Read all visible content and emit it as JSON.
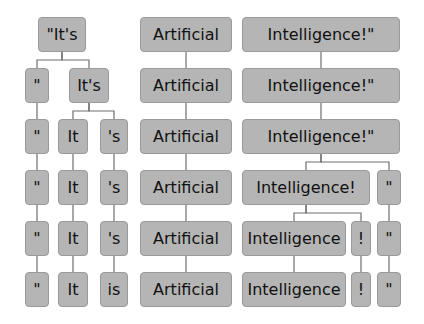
{
  "colors": {
    "node_fill": "#b5b5b5",
    "node_border": "#9a9a9a",
    "edge": "#6e6e6e",
    "text": "#111111"
  },
  "rows": [
    [
      {
        "id": "r1a",
        "text": "\"It's",
        "x": 38,
        "w": 48
      },
      {
        "id": "r1b",
        "text": "Artificial",
        "x": 140,
        "w": 92
      },
      {
        "id": "r1c",
        "text": "Intelligence!\"",
        "x": 242,
        "w": 158
      }
    ],
    [
      {
        "id": "r2a",
        "text": "\"",
        "x": 25,
        "w": 24
      },
      {
        "id": "r2b",
        "text": "It's",
        "x": 69,
        "w": 40
      },
      {
        "id": "r2c",
        "text": "Artificial",
        "x": 140,
        "w": 92
      },
      {
        "id": "r2d",
        "text": "Intelligence!\"",
        "x": 242,
        "w": 158
      }
    ],
    [
      {
        "id": "r3a",
        "text": "\"",
        "x": 25,
        "w": 24
      },
      {
        "id": "r3b",
        "text": "It",
        "x": 58,
        "w": 30
      },
      {
        "id": "r3c",
        "text": "'s",
        "x": 100,
        "w": 28
      },
      {
        "id": "r3d",
        "text": "Artificial",
        "x": 140,
        "w": 92
      },
      {
        "id": "r3e",
        "text": "Intelligence!\"",
        "x": 242,
        "w": 158
      }
    ],
    [
      {
        "id": "r4a",
        "text": "\"",
        "x": 25,
        "w": 24
      },
      {
        "id": "r4b",
        "text": "It",
        "x": 58,
        "w": 30
      },
      {
        "id": "r4c",
        "text": "'s",
        "x": 100,
        "w": 28
      },
      {
        "id": "r4d",
        "text": "Artificial",
        "x": 140,
        "w": 92
      },
      {
        "id": "r4e",
        "text": "Intelligence!",
        "x": 242,
        "w": 128
      },
      {
        "id": "r4f",
        "text": "\"",
        "x": 377,
        "w": 24
      }
    ],
    [
      {
        "id": "r5a",
        "text": "\"",
        "x": 25,
        "w": 24
      },
      {
        "id": "r5b",
        "text": "It",
        "x": 58,
        "w": 30
      },
      {
        "id": "r5c",
        "text": "'s",
        "x": 100,
        "w": 28
      },
      {
        "id": "r5d",
        "text": "Artificial",
        "x": 140,
        "w": 92
      },
      {
        "id": "r5e",
        "text": "Intelligence",
        "x": 242,
        "w": 104
      },
      {
        "id": "r5f",
        "text": "!",
        "x": 351,
        "w": 20
      },
      {
        "id": "r5g",
        "text": "\"",
        "x": 377,
        "w": 24
      }
    ],
    [
      {
        "id": "r6a",
        "text": "\"",
        "x": 25,
        "w": 24
      },
      {
        "id": "r6b",
        "text": "It",
        "x": 58,
        "w": 30
      },
      {
        "id": "r6c",
        "text": "is",
        "x": 100,
        "w": 28
      },
      {
        "id": "r6d",
        "text": "Artificial",
        "x": 140,
        "w": 92
      },
      {
        "id": "r6e",
        "text": "Intelligence",
        "x": 242,
        "w": 104
      },
      {
        "id": "r6f",
        "text": "!",
        "x": 351,
        "w": 20
      },
      {
        "id": "r6g",
        "text": "\"",
        "x": 377,
        "w": 24
      }
    ]
  ],
  "row_tops": [
    17,
    68,
    119,
    170,
    221,
    272
  ],
  "edges": [
    [
      "r1a",
      "r2a"
    ],
    [
      "r1a",
      "r2b"
    ],
    [
      "r1b",
      "r2c"
    ],
    [
      "r1c",
      "r2d"
    ],
    [
      "r2a",
      "r3a"
    ],
    [
      "r2b",
      "r3b"
    ],
    [
      "r2b",
      "r3c"
    ],
    [
      "r2c",
      "r3d"
    ],
    [
      "r2d",
      "r3e"
    ],
    [
      "r3a",
      "r4a"
    ],
    [
      "r3b",
      "r4b"
    ],
    [
      "r3c",
      "r4c"
    ],
    [
      "r3d",
      "r4d"
    ],
    [
      "r3e",
      "r4e"
    ],
    [
      "r3e",
      "r4f"
    ],
    [
      "r4a",
      "r5a"
    ],
    [
      "r4b",
      "r5b"
    ],
    [
      "r4c",
      "r5c"
    ],
    [
      "r4d",
      "r5d"
    ],
    [
      "r4e",
      "r5e"
    ],
    [
      "r4e",
      "r5f"
    ],
    [
      "r4f",
      "r5g"
    ],
    [
      "r5a",
      "r6a"
    ],
    [
      "r5b",
      "r6b"
    ],
    [
      "r5c",
      "r6c"
    ],
    [
      "r5d",
      "r6d"
    ],
    [
      "r5e",
      "r6e"
    ],
    [
      "r5f",
      "r6f"
    ],
    [
      "r5g",
      "r6g"
    ]
  ]
}
